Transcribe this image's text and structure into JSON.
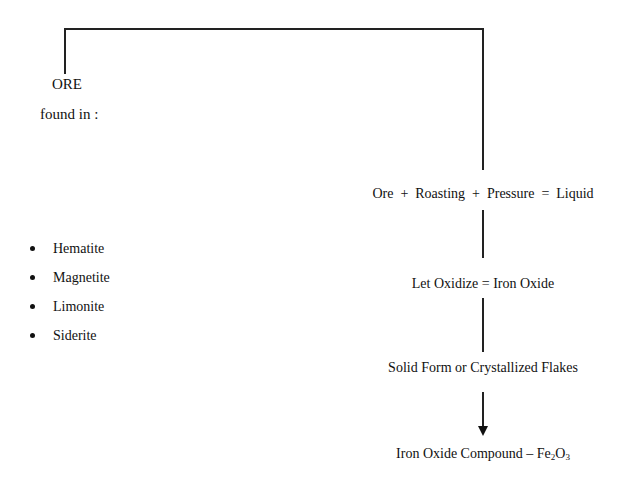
{
  "diagram": {
    "root": {
      "title": "ORE",
      "subtitle": "found in :"
    },
    "ores": [
      "Hematite",
      "Magnetite",
      "Limonite",
      "Siderite"
    ],
    "steps": [
      "Ore  +  Roasting  +  Pressure  =  Liquid",
      "Let Oxidize = Iron Oxide",
      "Solid Form or Crystallized Flakes"
    ],
    "result": {
      "prefix": "Iron Oxide Compound – Fe",
      "sub1": "2",
      "mid": "O",
      "sub2": "3"
    }
  }
}
